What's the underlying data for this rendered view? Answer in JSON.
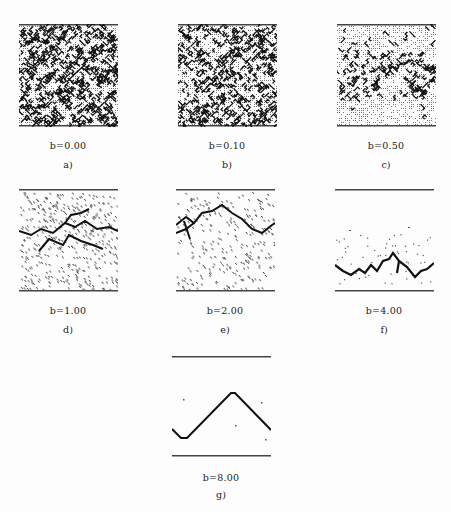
{
  "figure": {
    "panels": [
      {
        "id": "a",
        "caption": "b=0.00",
        "label": "a)",
        "x": 19,
        "y": 24,
        "density": 0.62,
        "style": "dense"
      },
      {
        "id": "b",
        "caption": "b=0.10",
        "label": "b)",
        "x": 178,
        "y": 24,
        "density": 0.52,
        "style": "dense"
      },
      {
        "id": "c",
        "caption": "b=0.50",
        "label": "c)",
        "x": 337,
        "y": 24,
        "density": 0.34,
        "style": "medium"
      },
      {
        "id": "d",
        "caption": "b=1.00",
        "label": "d)",
        "x": 19,
        "y": 189,
        "density": 0.14,
        "style": "sparse"
      },
      {
        "id": "e",
        "caption": "b=2.00",
        "label": "e)",
        "x": 176,
        "y": 189,
        "density": 0.09,
        "style": "sparse"
      },
      {
        "id": "f",
        "caption": "b=4.00",
        "label": "f)",
        "x": 335,
        "y": 189,
        "density": 0.0,
        "style": "lines"
      },
      {
        "id": "g",
        "caption": "b=8.00",
        "label": "g)",
        "x": 172,
        "y": 356,
        "density": 0.0,
        "style": "lines"
      }
    ]
  }
}
